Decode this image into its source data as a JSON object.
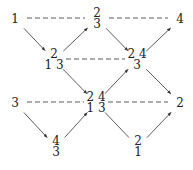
{
  "diagram": {
    "type": "weight-lattice-graph",
    "nodes": [
      {
        "id": "A",
        "x": 15,
        "y": 19,
        "rows": [
          "1"
        ]
      },
      {
        "id": "B",
        "x": 97,
        "y": 19,
        "rows": [
          "2",
          "3"
        ]
      },
      {
        "id": "C",
        "x": 180,
        "y": 19,
        "rows": [
          "4"
        ]
      },
      {
        "id": "D",
        "x": 54,
        "y": 60,
        "rows": [
          "2",
          "1 3"
        ]
      },
      {
        "id": "E",
        "x": 137,
        "y": 60,
        "rows": [
          "2 4",
          "3"
        ]
      },
      {
        "id": "F",
        "x": 15,
        "y": 103,
        "rows": [
          "3"
        ]
      },
      {
        "id": "G",
        "x": 96,
        "y": 103,
        "rows": [
          "2 4",
          "1 3"
        ]
      },
      {
        "id": "H",
        "x": 180,
        "y": 103,
        "rows": [
          "2"
        ]
      },
      {
        "id": "I",
        "x": 56,
        "y": 147,
        "rows": [
          "4",
          "3"
        ]
      },
      {
        "id": "J",
        "x": 138,
        "y": 147,
        "rows": [
          "2",
          "1"
        ]
      }
    ],
    "arrows": [
      {
        "from": "A",
        "to": "D"
      },
      {
        "from": "D",
        "to": "B"
      },
      {
        "from": "B",
        "to": "E"
      },
      {
        "from": "E",
        "to": "C"
      },
      {
        "from": "D",
        "to": "G"
      },
      {
        "from": "G",
        "to": "E"
      },
      {
        "from": "E",
        "to": "H"
      },
      {
        "from": "F",
        "to": "I"
      },
      {
        "from": "I",
        "to": "G"
      },
      {
        "from": "G",
        "to": "J",
        "no_head": true
      },
      {
        "from": "J",
        "to": "H"
      }
    ],
    "dashed": [
      {
        "from": "A",
        "to": "B"
      },
      {
        "from": "B",
        "to": "C"
      },
      {
        "from": "D",
        "to": "E"
      },
      {
        "from": "F",
        "to": "G"
      },
      {
        "from": "G",
        "to": "H"
      }
    ],
    "colors": {
      "line": "#333333",
      "text": "#222222",
      "background": "#ffffff"
    }
  }
}
